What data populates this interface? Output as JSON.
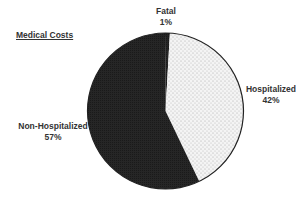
{
  "title": "Medical Costs",
  "labels": {
    "fatal": {
      "name": "Fatal",
      "pct": "1%"
    },
    "hospitalized": {
      "name": "Hospitalized",
      "pct": "42%"
    },
    "non_hospitalized": {
      "name": "Non-Hospitalized",
      "pct": "57%"
    }
  },
  "colors": {
    "dark_fill": "#262626",
    "dotted_fill": "#f4f4f4",
    "dot_color": "#9a9a9a",
    "outline": "#222222",
    "text": "#333333"
  },
  "chart_data": {
    "type": "pie",
    "title": "Medical Costs",
    "categories": [
      "Fatal",
      "Hospitalized",
      "Non-Hospitalized"
    ],
    "values": [
      1,
      42,
      57
    ],
    "unit": "%",
    "slice_styles": [
      "solid dark",
      "light dotted",
      "solid dark"
    ],
    "legend": "none (direct labels)",
    "start_angle": "12 o'clock, clockwise"
  }
}
